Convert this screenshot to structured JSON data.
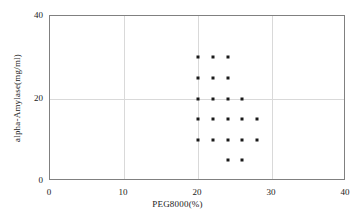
{
  "chart_data": {
    "type": "scatter",
    "title": "",
    "xlabel": "PEG8000(%)",
    "ylabel": "alpha-Amylase(mg/ml)",
    "xlim": [
      0,
      40
    ],
    "ylim": [
      0,
      40
    ],
    "xticks": [
      0,
      10,
      20,
      30,
      40
    ],
    "yticks": [
      0,
      20,
      40
    ],
    "xtick_labels": [
      "0",
      "10",
      "20",
      "30",
      "40"
    ],
    "ytick_labels": [
      "0",
      "20",
      "40"
    ],
    "grid": true,
    "legend": false,
    "marker": "square",
    "marker_color": "#1a1a1a",
    "series": [
      {
        "name": "alpha-Amylase vs PEG8000",
        "points": [
          {
            "x": 20,
            "y": 30
          },
          {
            "x": 22,
            "y": 30
          },
          {
            "x": 24,
            "y": 30
          },
          {
            "x": 20,
            "y": 25
          },
          {
            "x": 22,
            "y": 25
          },
          {
            "x": 24,
            "y": 25
          },
          {
            "x": 20,
            "y": 20
          },
          {
            "x": 22,
            "y": 20
          },
          {
            "x": 24,
            "y": 20
          },
          {
            "x": 26,
            "y": 20
          },
          {
            "x": 20,
            "y": 15
          },
          {
            "x": 22,
            "y": 15
          },
          {
            "x": 24,
            "y": 15
          },
          {
            "x": 26,
            "y": 15
          },
          {
            "x": 28,
            "y": 15
          },
          {
            "x": 20,
            "y": 10
          },
          {
            "x": 22,
            "y": 10
          },
          {
            "x": 24,
            "y": 10
          },
          {
            "x": 26,
            "y": 10
          },
          {
            "x": 28,
            "y": 10
          },
          {
            "x": 24,
            "y": 5
          },
          {
            "x": 26,
            "y": 5
          }
        ]
      }
    ]
  }
}
